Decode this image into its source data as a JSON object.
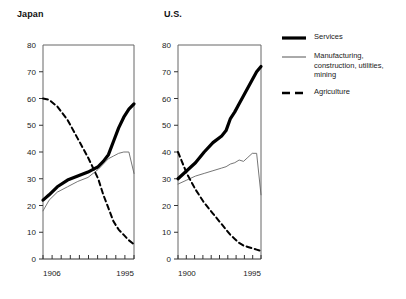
{
  "panels": [
    {
      "title": "Japan",
      "x_start_label": "1906",
      "x_end_label": "1995"
    },
    {
      "title": "U.S.",
      "x_start_label": "1900",
      "x_end_label": "1995"
    }
  ],
  "legend": {
    "items": [
      {
        "label": "Services",
        "style": "thick-solid",
        "color": "#000000"
      },
      {
        "label": "Manufacturing,\nconstruction, utilities,\nmining",
        "style": "thin-solid",
        "color": "#555555"
      },
      {
        "label": "Agriculture",
        "style": "dashed",
        "color": "#000000"
      }
    ]
  },
  "chart_data": [
    {
      "type": "line",
      "title": "Japan",
      "xlabel": "",
      "ylabel": "",
      "xlim": [
        1906,
        1995
      ],
      "ylim": [
        0,
        80
      ],
      "yticks": [
        0,
        10,
        20,
        30,
        40,
        50,
        60,
        70,
        80
      ],
      "xticks": [
        1906,
        1995
      ],
      "xtick_labels": [
        "1906",
        "1995"
      ],
      "grid": false,
      "legend_position": "right-outside",
      "series": [
        {
          "name": "Services",
          "x": [
            1906,
            1912,
            1920,
            1930,
            1940,
            1950,
            1955,
            1960,
            1965,
            1970,
            1975,
            1980,
            1985,
            1990,
            1995
          ],
          "values": [
            22,
            24,
            27,
            29.5,
            31,
            32.5,
            33.5,
            34.5,
            36.5,
            39,
            44,
            49,
            53,
            56,
            58
          ]
        },
        {
          "name": "Manufacturing, construction, utilities, mining",
          "x": [
            1906,
            1912,
            1920,
            1930,
            1940,
            1950,
            1955,
            1960,
            1965,
            1970,
            1975,
            1980,
            1985,
            1990,
            1995
          ],
          "values": [
            18,
            22,
            25,
            27,
            29,
            30.5,
            32,
            33.5,
            35.5,
            37.5,
            38.5,
            39.5,
            40,
            40,
            32
          ]
        },
        {
          "name": "Agriculture",
          "x": [
            1906,
            1912,
            1920,
            1930,
            1940,
            1950,
            1955,
            1960,
            1965,
            1970,
            1975,
            1980,
            1985,
            1990,
            1995
          ],
          "values": [
            60,
            59.5,
            57,
            52,
            45,
            38,
            34,
            30,
            24,
            19,
            14,
            11,
            9,
            7,
            5.5
          ]
        }
      ]
    },
    {
      "type": "line",
      "title": "U.S.",
      "xlabel": "",
      "ylabel": "",
      "xlim": [
        1900,
        1995
      ],
      "ylim": [
        0,
        80
      ],
      "yticks": [
        0,
        10,
        20,
        30,
        40,
        50,
        60,
        70,
        80
      ],
      "xticks": [
        1900,
        1995
      ],
      "xtick_labels": [
        "1900",
        "1995"
      ],
      "grid": false,
      "legend_position": "right-outside",
      "series": [
        {
          "name": "Services",
          "x": [
            1900,
            1910,
            1920,
            1930,
            1940,
            1950,
            1955,
            1960,
            1965,
            1970,
            1975,
            1980,
            1985,
            1990,
            1995
          ],
          "values": [
            30,
            33,
            36,
            40,
            43.5,
            46,
            48,
            52.5,
            55,
            58,
            61,
            64,
            67,
            70,
            72
          ]
        },
        {
          "name": "Manufacturing, construction, utilities, mining",
          "x": [
            1900,
            1910,
            1920,
            1930,
            1940,
            1950,
            1955,
            1960,
            1965,
            1970,
            1975,
            1980,
            1985,
            1990,
            1995
          ],
          "values": [
            28,
            29.5,
            31,
            32,
            33,
            34,
            34.5,
            35.5,
            36,
            37,
            36.5,
            38,
            39.5,
            39.5,
            24
          ]
        },
        {
          "name": "Agriculture",
          "x": [
            1900,
            1910,
            1920,
            1930,
            1940,
            1950,
            1955,
            1960,
            1965,
            1970,
            1975,
            1980,
            1985,
            1990,
            1995
          ],
          "values": [
            40,
            32,
            26,
            21,
            17,
            13,
            11,
            9,
            7.5,
            6,
            5,
            4.5,
            4,
            3.5,
            3
          ]
        }
      ]
    }
  ]
}
